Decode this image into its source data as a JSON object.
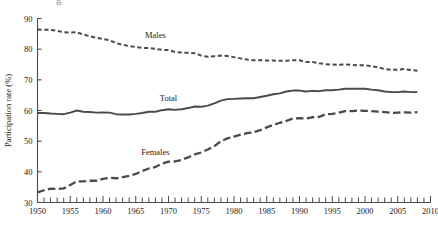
{
  "figure": {
    "cropped_title_fragment": "g",
    "axis_color": "#4a4a4a",
    "line_color": "#4a4a4a",
    "background": "#ffffff"
  },
  "chart_data": {
    "type": "line",
    "title": "",
    "xlabel": "",
    "ylabel": "Participation rate (%)",
    "xlim": [
      1950,
      2010
    ],
    "ylim": [
      30,
      90
    ],
    "grid": false,
    "legend": "inline-labels",
    "x_ticks_major": [
      1950,
      1955,
      1960,
      1965,
      1970,
      1975,
      1980,
      1985,
      1990,
      1995,
      2000,
      2005,
      2010
    ],
    "x_tick_labels": [
      "1950",
      "1955",
      "1960",
      "1965",
      "1970",
      "1975",
      "1980",
      "1985",
      "1990",
      "1995",
      "2000",
      "2005",
      "2010"
    ],
    "x_minor_tick_interval": 1,
    "y_ticks": [
      30,
      40,
      50,
      60,
      70,
      80,
      90
    ],
    "y_tick_labels": [
      "30",
      "40",
      "50",
      "60",
      "70",
      "80",
      "90"
    ],
    "x": [
      1950,
      1951,
      1952,
      1953,
      1954,
      1955,
      1956,
      1957,
      1958,
      1959,
      1960,
      1961,
      1962,
      1963,
      1964,
      1965,
      1966,
      1967,
      1968,
      1969,
      1970,
      1971,
      1972,
      1973,
      1974,
      1975,
      1976,
      1977,
      1978,
      1979,
      1980,
      1981,
      1982,
      1983,
      1984,
      1985,
      1986,
      1987,
      1988,
      1989,
      1990,
      1991,
      1992,
      1993,
      1994,
      1995,
      1996,
      1997,
      1998,
      1999,
      2000,
      2001,
      2002,
      2003,
      2004,
      2005,
      2006,
      2007,
      2008
    ],
    "series": [
      {
        "name": "Males",
        "style": "short-dash",
        "label_position": {
          "x": 1968,
          "y": 83.5
        },
        "values": [
          86.4,
          86.3,
          86.3,
          86.0,
          85.5,
          85.4,
          85.5,
          84.8,
          84.2,
          83.7,
          83.3,
          82.9,
          82.0,
          81.4,
          81.0,
          80.7,
          80.4,
          80.4,
          80.1,
          79.8,
          79.7,
          79.1,
          78.9,
          78.8,
          78.7,
          77.9,
          77.5,
          77.7,
          77.9,
          77.8,
          77.4,
          77.0,
          76.6,
          76.4,
          76.4,
          76.3,
          76.3,
          76.2,
          76.2,
          76.4,
          76.4,
          75.8,
          75.8,
          75.4,
          75.1,
          75.0,
          74.9,
          75.0,
          74.9,
          74.7,
          74.8,
          74.4,
          74.1,
          73.5,
          73.3,
          73.3,
          73.5,
          73.2,
          73.0
        ]
      },
      {
        "name": "Total",
        "style": "solid",
        "label_position": {
          "x": 1970,
          "y": 63.0
        },
        "values": [
          59.2,
          59.2,
          59.0,
          58.9,
          58.8,
          59.3,
          60.0,
          59.6,
          59.5,
          59.3,
          59.4,
          59.3,
          58.8,
          58.7,
          58.7,
          58.9,
          59.2,
          59.6,
          59.6,
          60.1,
          60.4,
          60.2,
          60.4,
          60.8,
          61.3,
          61.2,
          61.6,
          62.3,
          63.2,
          63.7,
          63.8,
          63.9,
          64.0,
          64.0,
          64.4,
          64.8,
          65.3,
          65.6,
          66.2,
          66.5,
          66.5,
          66.2,
          66.4,
          66.3,
          66.6,
          66.6,
          66.8,
          67.1,
          67.1,
          67.1,
          67.1,
          66.8,
          66.6,
          66.2,
          66.0,
          66.0,
          66.2,
          66.0,
          66.0
        ]
      },
      {
        "name": "Females",
        "style": "long-dash",
        "label_position": {
          "x": 1968,
          "y": 45.5
        },
        "values": [
          33.3,
          34.0,
          34.5,
          34.4,
          34.6,
          35.7,
          36.9,
          36.9,
          37.1,
          37.1,
          37.7,
          38.1,
          37.9,
          38.3,
          38.7,
          39.3,
          40.3,
          41.1,
          41.6,
          42.7,
          43.3,
          43.4,
          43.9,
          44.7,
          45.7,
          46.3,
          47.3,
          48.4,
          50.0,
          50.9,
          51.5,
          52.1,
          52.6,
          52.9,
          53.6,
          54.5,
          55.3,
          56.0,
          56.6,
          57.4,
          57.5,
          57.4,
          57.8,
          57.9,
          58.8,
          58.9,
          59.3,
          59.8,
          59.8,
          60.0,
          59.9,
          59.8,
          59.6,
          59.5,
          59.2,
          59.3,
          59.4,
          59.3,
          59.5
        ]
      }
    ]
  }
}
